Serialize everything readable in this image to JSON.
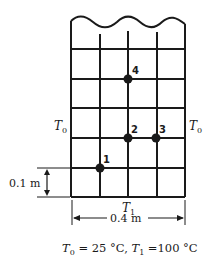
{
  "diagram": {
    "type": "finite-difference-grid",
    "grid": {
      "columns": 4,
      "rows_visible": 5,
      "top_edge": "wavy (continues upward)",
      "spacing_label": "0.1 m",
      "width_label": "0.4 m"
    },
    "boundaries": {
      "left": {
        "symbol": "T",
        "sub": "0"
      },
      "right": {
        "symbol": "T",
        "sub": "0"
      },
      "bottom": {
        "symbol": "T",
        "sub": "1"
      }
    },
    "nodes": [
      {
        "id": "1",
        "label": "1",
        "col": 1,
        "row_from_bottom": 1
      },
      {
        "id": "2",
        "label": "2",
        "col": 2,
        "row_from_bottom": 2
      },
      {
        "id": "3",
        "label": "3",
        "col": 3,
        "row_from_bottom": 2
      },
      {
        "id": "4",
        "label": "4",
        "col": 2,
        "row_from_bottom": 4
      }
    ],
    "conditions": {
      "t0_symbol": "T",
      "t0_sub": "0",
      "t0_value": " = 25 °C, ",
      "t1_symbol": "T",
      "t1_sub": "1",
      "t1_value": " =100 °C"
    }
  }
}
